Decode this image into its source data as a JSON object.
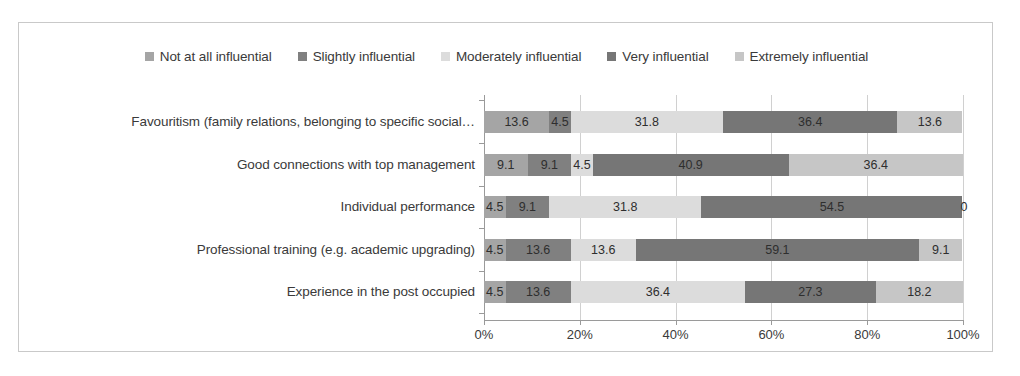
{
  "chart_data": {
    "type": "bar",
    "subtype": "horizontal-stacked-100",
    "title": "",
    "xlabel": "",
    "ylabel": "",
    "xlim": [
      0,
      100
    ],
    "xticks": [
      "0%",
      "20%",
      "40%",
      "60%",
      "80%",
      "100%"
    ],
    "xtick_values": [
      0,
      20,
      40,
      60,
      80,
      100
    ],
    "grid": "vertical",
    "legend_position": "top-center",
    "categories": [
      "Favouritism (family relations, belonging to specific social…",
      "Good connections with top management",
      "Individual performance",
      "Professional training (e.g. academic upgrading)",
      "Experience in the post occupied"
    ],
    "series": [
      {
        "name": "Not at all influential",
        "color": "#a5a5a5",
        "values": [
          13.6,
          9.1,
          4.5,
          4.5,
          4.5
        ],
        "labels": [
          "13.6",
          "9.1",
          "4.5",
          "4.5",
          "4.5"
        ]
      },
      {
        "name": "Slightly influential",
        "color": "#808080",
        "values": [
          4.5,
          9.1,
          9.1,
          13.6,
          13.6
        ],
        "labels": [
          "4.5",
          "9.1",
          "9.1",
          "13.6",
          "13.6"
        ]
      },
      {
        "name": "Moderately influential",
        "color": "#dcdcdc",
        "values": [
          31.8,
          4.5,
          31.8,
          13.6,
          36.4
        ],
        "labels": [
          "31.8",
          "4.5",
          "31.8",
          "13.6",
          "36.4"
        ]
      },
      {
        "name": "Very influential",
        "color": "#767676",
        "values": [
          36.4,
          40.9,
          54.5,
          59.1,
          27.3
        ],
        "labels": [
          "36.4",
          "40.9",
          "54.5",
          "59.1",
          "27.3"
        ]
      },
      {
        "name": "Extremely influential",
        "color": "#c6c6c6",
        "values": [
          13.6,
          36.4,
          0,
          9.1,
          18.2
        ],
        "labels": [
          "13.6",
          "36.4",
          "0",
          "9.1",
          "18.2"
        ]
      }
    ]
  }
}
